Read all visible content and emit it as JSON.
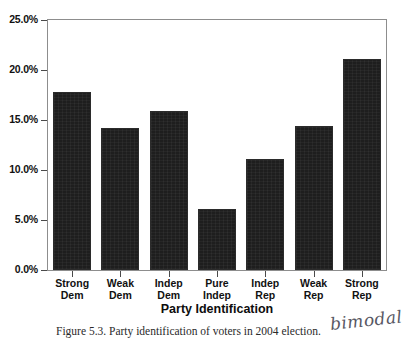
{
  "chart_data": {
    "type": "bar",
    "title": "",
    "xlabel": "Party Identification",
    "ylabel": "",
    "categories": [
      "Strong Dem",
      "Weak Dem",
      "Indep Dem",
      "Pure Indep",
      "Indep Rep",
      "Weak Rep",
      "Strong Rep"
    ],
    "category_lines": [
      [
        "Strong",
        "Dem"
      ],
      [
        "Weak",
        "Dem"
      ],
      [
        "Indep",
        "Dem"
      ],
      [
        "Pure",
        "Indep"
      ],
      [
        "Indep",
        "Rep"
      ],
      [
        "Weak",
        "Rep"
      ],
      [
        "Strong",
        "Rep"
      ]
    ],
    "values": [
      17.8,
      14.2,
      15.9,
      6.1,
      11.1,
      14.4,
      21.1
    ],
    "value_labels": [
      "17.8%",
      "14.2%",
      "15.9%",
      "6.1%",
      "11.1%",
      "14.4%",
      "21.1%"
    ],
    "ylim": [
      0,
      25
    ],
    "ytick_values": [
      0,
      5,
      10,
      15,
      20,
      25
    ],
    "ytick_labels": [
      "0.0%",
      "5.0%",
      "10.0%",
      "15.0%",
      "20.0%",
      "25.0%"
    ],
    "grid": false,
    "legend": false,
    "bar_color": "#1e1e1e",
    "frame_color": "#8d8d8d"
  },
  "caption": {
    "text": "Figure 5.3. Party identification of voters in 2004 election."
  },
  "annotation": {
    "handwritten_note": "bimodal"
  }
}
